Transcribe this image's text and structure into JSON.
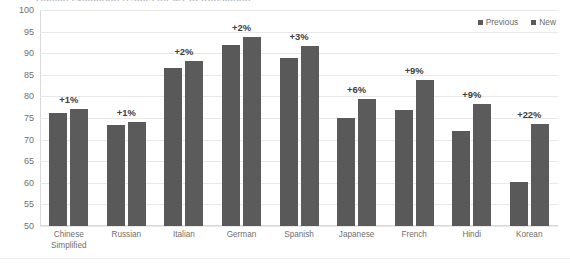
{
  "chart_data": {
    "type": "bar",
    "title": "Human evaluation results for MT of translation",
    "categories": [
      "Chinese Simplified",
      "Russian",
      "Italian",
      "German",
      "Spanish",
      "Japanese",
      "French",
      "Hindi",
      "Korean"
    ],
    "series": [
      {
        "name": "Previous",
        "color": "#595959",
        "values": [
          76.2,
          73.3,
          86.5,
          92.0,
          89.0,
          75.0,
          76.8,
          72.0,
          60.2
        ]
      },
      {
        "name": "New",
        "color": "#5b5b5b",
        "values": [
          77.0,
          74.1,
          88.3,
          93.8,
          91.6,
          79.4,
          83.8,
          78.3,
          73.5
        ]
      }
    ],
    "delta_labels": [
      "+1%",
      "+1%",
      "+2%",
      "+2%",
      "+3%",
      "+6%",
      "+9%",
      "+9%",
      "+22%"
    ],
    "ylim": [
      50,
      100
    ],
    "yticks": [
      100,
      95,
      90,
      85,
      80,
      75,
      70,
      65,
      60,
      55,
      50
    ],
    "ylabel": "",
    "xlabel": "",
    "grid": true,
    "legend_position": "top-right"
  }
}
